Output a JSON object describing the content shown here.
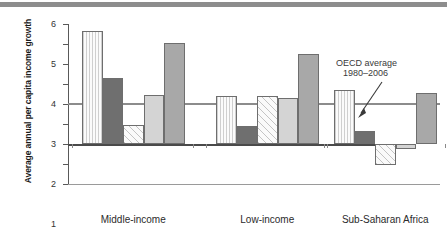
{
  "chart_data": {
    "type": "bar",
    "title": "",
    "xlabel": "",
    "ylabel": "Average annual per capita income growth",
    "categories": [
      "Middle-income",
      "Low-income",
      "Sub-Saharan Africa"
    ],
    "ylim": [
      -2,
      6
    ],
    "ytick_labels": [
      "6",
      "5",
      "4",
      "3",
      "2",
      "1",
      "0",
      "−1",
      "−2"
    ],
    "ytick_values": [
      6,
      5,
      4,
      3,
      2,
      1,
      0,
      -1,
      -2
    ],
    "grid": false,
    "legend": "none",
    "series": [
      {
        "name": "series-1",
        "pattern": "vertical-stripes",
        "values": [
          5.65,
          2.4,
          2.7
        ]
      },
      {
        "name": "series-2",
        "pattern": "dark-solid",
        "values": [
          3.3,
          0.9,
          0.65
        ]
      },
      {
        "name": "series-3",
        "pattern": "diagonal-hatch",
        "values": [
          0.95,
          2.42,
          -1.05
        ]
      },
      {
        "name": "series-4",
        "pattern": "light-solid",
        "values": [
          2.45,
          2.28,
          -0.25
        ]
      },
      {
        "name": "series-5",
        "pattern": "medium-solid",
        "values": [
          5.05,
          4.5,
          2.55
        ]
      }
    ],
    "reference_line": {
      "value": 2.05,
      "label_line1": "OECD average",
      "label_line2": "1980–2006"
    }
  }
}
